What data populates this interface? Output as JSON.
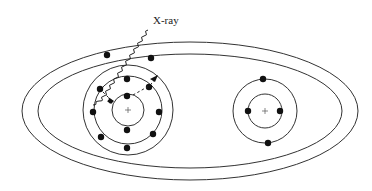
{
  "diagram": {
    "labels": {
      "xray": "X-ray"
    },
    "molecule": {
      "outer_orbitals": 2,
      "molecular_electrons": 2
    },
    "atoms": [
      {
        "name": "left-atom",
        "shells": [
          {
            "name": "inner-shell",
            "electrons": 2
          },
          {
            "name": "middle-shell",
            "electrons": 8
          }
        ],
        "outer_shell_present": true
      },
      {
        "name": "right-atom",
        "shells": [
          {
            "name": "inner-shell",
            "electrons": 2
          },
          {
            "name": "outer-shell",
            "electrons": 2
          }
        ]
      }
    ],
    "nucleus_symbol": "+",
    "arrows": [
      {
        "name": "inner-transition-arrow",
        "style": "dashed"
      },
      {
        "name": "ejection-arrow",
        "style": "dashed"
      }
    ],
    "colors": {
      "line": "#333333",
      "electron": "#111111",
      "background": "#ffffff"
    }
  }
}
